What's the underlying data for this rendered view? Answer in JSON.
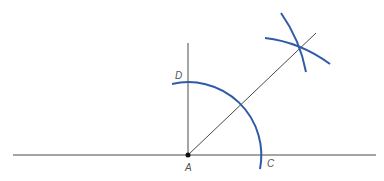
{
  "diagram": {
    "colors": {
      "line": "#4a4a4a",
      "arc": "#2f5aa8",
      "label": "#555555",
      "point": "#111111"
    },
    "points": {
      "A": {
        "label": "A",
        "x": 188,
        "y": 155
      },
      "C": {
        "label": "C",
        "x": 261,
        "y": 155
      },
      "D": {
        "label": "D",
        "x": 188,
        "y": 82
      }
    },
    "labels": [
      {
        "id": "A",
        "text": "A",
        "x": 185,
        "y": 171
      },
      {
        "id": "C",
        "text": "C",
        "x": 267,
        "y": 167
      },
      {
        "id": "D",
        "text": "D",
        "x": 175,
        "y": 79
      }
    ],
    "lines": [
      {
        "name": "horizontal-line",
        "x1": 13,
        "y1": 155,
        "x2": 376,
        "y2": 155
      },
      {
        "name": "perpendicular-line",
        "x1": 188,
        "y1": 43,
        "x2": 188,
        "y2": 155
      },
      {
        "name": "bisector-ray",
        "x1": 188,
        "y1": 155,
        "x2": 316,
        "y2": 33
      }
    ],
    "arcs": [
      {
        "name": "main-arc",
        "center": "A",
        "radius": 73
      },
      {
        "name": "arc-from-d",
        "note": "intersection arc"
      },
      {
        "name": "arc-from-c",
        "note": "intersection arc"
      }
    ]
  }
}
